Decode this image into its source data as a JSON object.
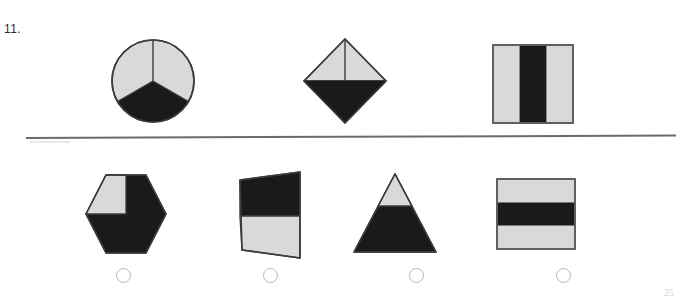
{
  "question": {
    "number_label": "11.",
    "page_number": "25"
  },
  "colors": {
    "shaded": "#1a1a1a",
    "unshaded": "#d9d9d9",
    "outline": "#4a4a4a",
    "divider": "#5e5e5e",
    "answer_circle_border": "#b9b9bd",
    "paper": "#ffffff"
  },
  "prompt_row": {
    "label": "prompt-figures",
    "figures": [
      {
        "name": "circle-thirds",
        "shape": "circle",
        "total_parts": 3,
        "shaded_parts": 1,
        "fraction": "1/3",
        "description": "Circle divided into three equal sectors with the bottom sector shaded"
      },
      {
        "name": "diamond-thirds",
        "shape": "diamond",
        "total_parts": 3,
        "shaded_parts": 1,
        "fraction": "1/3",
        "description": "Diamond split into a lower triangle and two upper triangles; lower triangle shaded"
      },
      {
        "name": "square-vertical-thirds",
        "shape": "square",
        "total_parts": 3,
        "shaded_parts": 1,
        "fraction": "1/3",
        "description": "Square divided into three vertical strips with the middle strip shaded"
      }
    ]
  },
  "answer_row": {
    "label": "answer-figures",
    "figures": [
      {
        "name": "hexagon-sixths",
        "shape": "hexagon",
        "total_parts": 6,
        "shaded_parts": 5,
        "fraction": "5/6",
        "description": "Hexagon with the upper-left section unshaded and the rest shaded"
      },
      {
        "name": "trapezoid-halves",
        "shape": "trapezoid",
        "total_parts": 2,
        "shaded_parts": 1,
        "fraction": "1/2",
        "description": "Quadrilateral split horizontally with the top half shaded"
      },
      {
        "name": "triangle-parts",
        "shape": "triangle",
        "total_parts": 3,
        "shaded_parts": 2,
        "fraction": "2/3",
        "description": "Triangle with the small top section unshaded and the lower portion shaded"
      },
      {
        "name": "rectangle-horizontal-thirds",
        "shape": "rectangle",
        "total_parts": 3,
        "shaded_parts": 1,
        "fraction": "1/3",
        "description": "Rectangle divided into three horizontal bands with the middle band shaded"
      }
    ]
  },
  "options": [
    {
      "id": "A",
      "selected": false
    },
    {
      "id": "B",
      "selected": false
    },
    {
      "id": "C",
      "selected": false
    },
    {
      "id": "D",
      "selected": false
    }
  ]
}
